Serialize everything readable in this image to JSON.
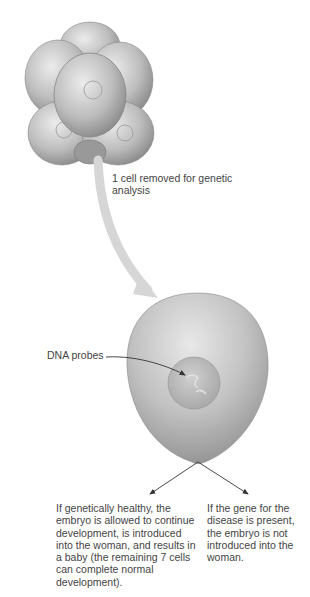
{
  "figure": {
    "embryo": {
      "cell_count": 8,
      "description": "8-cell embryo cluster"
    },
    "labels": {
      "cell_removed": "1 cell removed for genetic analysis",
      "dna_probes": "DNA probes",
      "outcome_healthy": "If genetically healthy, the embryo is allowed to continue development, is introduced into the woman, and results in a baby (the remaining 7 cells can complete normal development).",
      "outcome_disease": "If the gene for the disease is present, the embryo is not introduced into the woman."
    },
    "colors": {
      "cell_light": "#e6e6e6",
      "cell_mid": "#b5b5b5",
      "cell_dark": "#7a7a7a",
      "transfer_arrow": "#d4d4d4",
      "text": "#444444",
      "leader_line": "#333333"
    }
  }
}
